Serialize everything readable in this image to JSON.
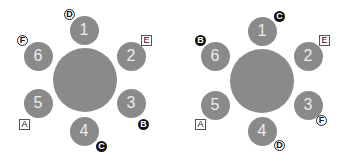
{
  "colors": {
    "table": "#8a8a8a",
    "seat": "#8a8a8a",
    "seat_text": "#ececec",
    "badge_dark": "#111111"
  },
  "diagrams": [
    {
      "id": "left",
      "table": {
        "cx": 85,
        "cy": 80,
        "r": 32
      },
      "seats": [
        {
          "label": "1",
          "cx": 84,
          "cy": 30
        },
        {
          "label": "2",
          "cx": 131,
          "cy": 56
        },
        {
          "label": "3",
          "cx": 131,
          "cy": 103
        },
        {
          "label": "4",
          "cx": 84,
          "cy": 131
        },
        {
          "label": "5",
          "cx": 38,
          "cy": 103
        },
        {
          "label": "6",
          "cx": 38,
          "cy": 56
        }
      ],
      "badges": [
        {
          "label": "D",
          "style": "outline",
          "x": 64,
          "y": 9
        },
        {
          "label": "E",
          "style": "square",
          "x": 141,
          "y": 35
        },
        {
          "label": "B",
          "style": "filled",
          "x": 138,
          "y": 119
        },
        {
          "label": "C",
          "style": "filled",
          "x": 96,
          "y": 141
        },
        {
          "label": "A",
          "style": "square",
          "x": 19,
          "y": 119
        },
        {
          "label": "F",
          "style": "outline",
          "x": 17,
          "y": 35
        }
      ]
    },
    {
      "id": "right",
      "table": {
        "cx": 262,
        "cy": 81,
        "r": 32
      },
      "seats": [
        {
          "label": "1",
          "cx": 262,
          "cy": 31
        },
        {
          "label": "2",
          "cx": 308,
          "cy": 56
        },
        {
          "label": "3",
          "cx": 308,
          "cy": 105
        },
        {
          "label": "4",
          "cx": 262,
          "cy": 131
        },
        {
          "label": "5",
          "cx": 215,
          "cy": 105
        },
        {
          "label": "6",
          "cx": 215,
          "cy": 56
        }
      ],
      "badges": [
        {
          "label": "C",
          "style": "filled",
          "x": 274,
          "y": 11
        },
        {
          "label": "E",
          "style": "square",
          "x": 319,
          "y": 35
        },
        {
          "label": "F",
          "style": "outline",
          "x": 316,
          "y": 115
        },
        {
          "label": "D",
          "style": "outline",
          "x": 274,
          "y": 140
        },
        {
          "label": "A",
          "style": "square",
          "x": 195,
          "y": 119
        },
        {
          "label": "B",
          "style": "filled",
          "x": 195,
          "y": 35
        }
      ]
    }
  ]
}
